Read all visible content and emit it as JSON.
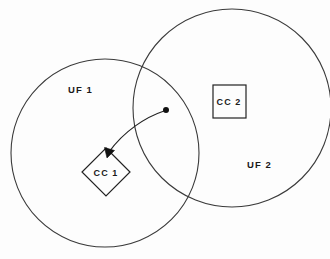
{
  "diagram": {
    "background_color": "#fdfdfd",
    "stroke_color": "#3a3a3a",
    "node_stroke_color": "#222222",
    "text_color": "#1a1a1a",
    "regions": [
      {
        "id": "uf1",
        "label": "UF  1",
        "shape": "circle",
        "cx": 105,
        "cy": 153,
        "r": 94,
        "label_x": 68,
        "label_y": 93
      },
      {
        "id": "uf2",
        "label": "UF  2",
        "shape": "circle",
        "cx": 232,
        "cy": 108,
        "r": 99,
        "label_x": 247,
        "label_y": 168
      }
    ],
    "nodes": [
      {
        "id": "cc1",
        "label": "CC  1",
        "shape": "diamond",
        "cx": 106,
        "cy": 172,
        "half_diagonal": 24,
        "label_x": 106,
        "label_y": 176,
        "contained_in": "uf1"
      },
      {
        "id": "cc2",
        "label": "CC  2",
        "shape": "square",
        "x": 213,
        "y": 85,
        "width": 33,
        "height": 33,
        "label_x": 229,
        "label_y": 105,
        "contained_in": "uf2"
      }
    ],
    "connector": {
      "id": "cc2-to-cc1-flow",
      "type": "curved-arrow",
      "source_dot": {
        "x": 166,
        "y": 110,
        "r": 3
      },
      "target": {
        "x": 107,
        "y": 157
      },
      "path": "M 164 111 C 146 117, 124 131, 109 152",
      "arrowhead_points": "107,158 104.5,147.5 114.5,150.5"
    }
  }
}
